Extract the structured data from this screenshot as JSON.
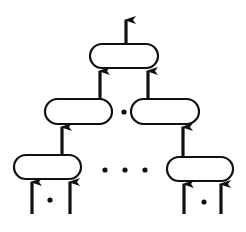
{
  "diagram": {
    "type": "tree",
    "colors": {
      "stroke": "#111111",
      "background": "#ffffff"
    },
    "nodes": [
      {
        "id": "root",
        "x": 90,
        "y": 44,
        "w": 68,
        "h": 24
      },
      {
        "id": "mid-left",
        "x": 45,
        "y": 99,
        "w": 67,
        "h": 25
      },
      {
        "id": "mid-right",
        "x": 131,
        "y": 99,
        "w": 68,
        "h": 25
      },
      {
        "id": "leaf-left",
        "x": 14,
        "y": 155,
        "w": 67,
        "h": 24
      },
      {
        "id": "leaf-right",
        "x": 167,
        "y": 157,
        "w": 66,
        "h": 24
      }
    ],
    "arrows": [
      {
        "id": "root-output",
        "x": 126,
        "y1": 44,
        "y2": 18
      },
      {
        "id": "mid-left-to-root",
        "x": 100,
        "y1": 99,
        "y2": 69
      },
      {
        "id": "mid-right-to-root",
        "x": 148,
        "y1": 99,
        "y2": 69
      },
      {
        "id": "leaf-left-to-mid-left",
        "x": 62,
        "y1": 155,
        "y2": 125
      },
      {
        "id": "leaf-right-to-mid-right",
        "x": 183,
        "y1": 157,
        "y2": 125
      },
      {
        "id": "leaf-left-input-1",
        "x": 32,
        "y1": 214,
        "y2": 180
      },
      {
        "id": "leaf-left-input-2",
        "x": 70,
        "y1": 214,
        "y2": 180
      },
      {
        "id": "leaf-right-input-1",
        "x": 184,
        "y1": 214,
        "y2": 182
      },
      {
        "id": "leaf-right-input-2",
        "x": 221,
        "y1": 214,
        "y2": 182
      }
    ],
    "ellipsis_dots": [
      {
        "id": "mid-level-dot",
        "x": 124,
        "y": 112
      },
      {
        "id": "leaf-level-dot-1",
        "x": 105,
        "y": 170
      },
      {
        "id": "leaf-level-dot-2",
        "x": 125,
        "y": 170
      },
      {
        "id": "leaf-level-dot-3",
        "x": 145,
        "y": 170
      },
      {
        "id": "leaf-left-input-dot",
        "x": 50,
        "y": 200
      },
      {
        "id": "leaf-right-input-dot",
        "x": 204,
        "y": 202
      }
    ]
  }
}
